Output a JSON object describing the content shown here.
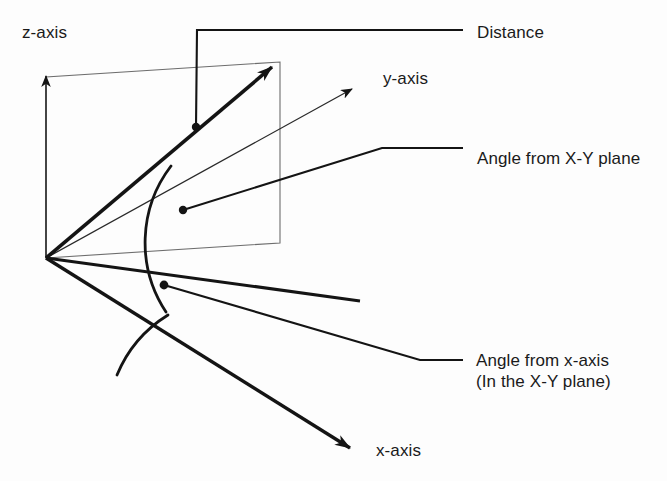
{
  "figure": {
    "type": "diagram",
    "background_color": "#fdfdfd",
    "line_color": "#1a1a1a",
    "thin_line_color": "#555555"
  },
  "labels": {
    "z_axis": "z-axis",
    "y_axis": "y-axis",
    "x_axis": "x-axis",
    "distance": "Distance",
    "angle_from_xy_plane": "Angle from X-Y plane",
    "angle_from_x_axis": "Angle from x-axis",
    "angle_from_x_axis_sub": "(In the X-Y plane)"
  },
  "geometry": {
    "origin": {
      "x": 46,
      "y": 258
    },
    "axes": [
      {
        "name": "z-axis",
        "from": [
          46,
          258
        ],
        "to": [
          46,
          72
        ],
        "style": "thin-arrow"
      },
      {
        "name": "y-axis",
        "from": [
          46,
          258
        ],
        "to": [
          355,
          87
        ],
        "style": "thin-arrow"
      },
      {
        "name": "x-axis",
        "from": [
          46,
          258
        ],
        "to": [
          355,
          452
        ],
        "style": "thick-arrow"
      }
    ],
    "vectors": [
      {
        "name": "distance-vector",
        "from": [
          46,
          258
        ],
        "to": [
          278,
          62
        ],
        "style": "thick-arrow"
      },
      {
        "name": "xy-projection-vector",
        "from": [
          46,
          258
        ],
        "to": [
          355,
          300
        ],
        "style": "thick-line"
      }
    ],
    "plane_rectangle": {
      "name": "vertical-plane",
      "points": [
        [
          46,
          258
        ],
        [
          280,
          243
        ],
        [
          280,
          62
        ],
        [
          46,
          77
        ]
      ]
    },
    "arcs": [
      {
        "name": "elevation-angle-arc",
        "center": [
          46,
          258
        ],
        "radius": 126
      },
      {
        "name": "azimuth-angle-arc",
        "center": [
          46,
          258
        ],
        "radius": 128
      }
    ],
    "markers": [
      {
        "name": "distance-marker-dot",
        "x": 196,
        "y": 127
      },
      {
        "name": "elevation-marker-dot",
        "x": 183,
        "y": 210
      },
      {
        "name": "azimuth-marker-dot",
        "x": 164,
        "y": 285
      }
    ],
    "leaders": [
      {
        "name": "distance-leader",
        "points": [
          [
            196,
            127
          ],
          [
            197,
            30
          ],
          [
            463,
            30
          ]
        ]
      },
      {
        "name": "angle-xy-leader",
        "points": [
          [
            183,
            210
          ],
          [
            382,
            148
          ],
          [
            463,
            148
          ]
        ]
      },
      {
        "name": "angle-x-leader",
        "points": [
          [
            164,
            285
          ],
          [
            420,
            360
          ],
          [
            463,
            360
          ]
        ]
      }
    ]
  }
}
